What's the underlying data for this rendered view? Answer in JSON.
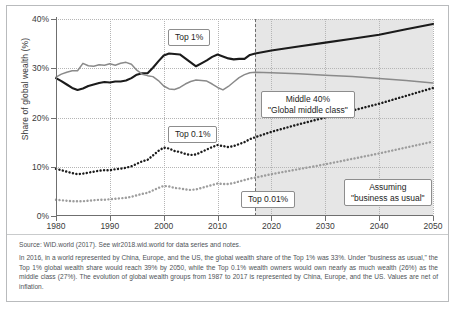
{
  "figure": {
    "source_line": "Source: WID.world (2017). See wir2018.wid.world for data series and notes.",
    "note": "In 2016, in a world represented by China, Europe, and the US, the global wealth share of the Top 1% was 33%. Under \"business as usual,\" the Top 1% global wealth share would reach 39% by 2050, while the Top 0.1% wealth owners would own nearly as much wealth (26%) as the middle class (27%). The evolution of global wealth groups from 1987 to 2017 is represented by China, Europe, and the US. Values are net of inflation."
  },
  "callouts": {
    "top1": "Top 1%",
    "middle40_line1": "Middle 40%",
    "middle40_line2": "\"Global middle class\"",
    "top01": "Top 0.1%",
    "top001": "Top 0.01%",
    "assuming_line1": "Assuming",
    "assuming_line2": "\"business as usual\""
  },
  "chart_data": {
    "type": "line",
    "title": "",
    "xlabel": "",
    "ylabel": "Share of global wealth (%)",
    "xlim": [
      1980,
      2050
    ],
    "ylim": [
      0,
      40
    ],
    "xticks": [
      1980,
      1990,
      2000,
      2010,
      2020,
      2030,
      2040,
      2050
    ],
    "xticklabels": [
      "1980",
      "1990",
      "2000",
      "2010",
      "2020",
      "2030",
      "2040",
      "2050"
    ],
    "yticks": [
      0,
      10,
      20,
      30,
      40
    ],
    "yticklabels": [
      "0%",
      "10%",
      "20%",
      "30%",
      "40%"
    ],
    "grid": true,
    "legend": "none (inline callout boxes)",
    "forecast_start": 2017,
    "forecast_shading": "#e2e2e2",
    "annotations": [
      {
        "text": "Top 1%",
        "x": 2000,
        "y": 36.5
      },
      {
        "text": "Middle 40% / \"Global middle class\"",
        "x": 2026,
        "y": 23.5
      },
      {
        "text": "Top 0.1%",
        "x": 2001,
        "y": 16.0
      },
      {
        "text": "Top 0.01%",
        "x": 2024,
        "y": 3.6
      },
      {
        "text": "Assuming \"business as usual\"",
        "x": 2040,
        "y": 5.4
      }
    ],
    "series": [
      {
        "name": "Top 1%",
        "color": "#1b1b1b",
        "style": "solid",
        "x": [
          1980,
          1981,
          1982,
          1983,
          1984,
          1985,
          1986,
          1987,
          1988,
          1989,
          1990,
          1991,
          1992,
          1993,
          1994,
          1995,
          1996,
          1997,
          1998,
          1999,
          2000,
          2001,
          2002,
          2003,
          2004,
          2005,
          2006,
          2007,
          2008,
          2009,
          2010,
          2011,
          2012,
          2013,
          2014,
          2015,
          2016,
          2017,
          2020,
          2025,
          2030,
          2035,
          2040,
          2045,
          2050
        ],
        "values": [
          28.0,
          27.4,
          26.7,
          26.0,
          25.6,
          25.9,
          26.4,
          26.7,
          27.0,
          27.2,
          27.1,
          27.3,
          27.3,
          27.5,
          28.0,
          28.7,
          29.0,
          29.0,
          30.1,
          31.4,
          32.6,
          33.0,
          32.9,
          32.8,
          32.0,
          31.2,
          30.4,
          31.0,
          31.6,
          32.3,
          32.8,
          32.4,
          32.0,
          31.8,
          31.9,
          31.9,
          32.7,
          33.0,
          33.6,
          34.4,
          35.2,
          36.0,
          36.8,
          37.9,
          39.0
        ]
      },
      {
        "name": "Middle 40%",
        "color": "#8a8a8a",
        "style": "solid",
        "x": [
          1980,
          1981,
          1982,
          1983,
          1984,
          1985,
          1986,
          1987,
          1988,
          1989,
          1990,
          1991,
          1992,
          1993,
          1994,
          1995,
          1996,
          1997,
          1998,
          1999,
          2000,
          2001,
          2002,
          2003,
          2004,
          2005,
          2006,
          2007,
          2008,
          2009,
          2010,
          2011,
          2012,
          2013,
          2014,
          2015,
          2016,
          2017,
          2020,
          2025,
          2030,
          2035,
          2040,
          2045,
          2050
        ],
        "values": [
          28.2,
          28.8,
          29.2,
          29.5,
          29.5,
          31.0,
          30.5,
          30.4,
          30.7,
          30.6,
          30.9,
          30.6,
          31.0,
          31.2,
          30.8,
          29.6,
          28.8,
          28.5,
          28.3,
          27.5,
          26.4,
          25.8,
          25.7,
          26.1,
          26.8,
          27.3,
          27.6,
          27.5,
          27.4,
          26.8,
          26.1,
          25.6,
          26.3,
          27.2,
          28.1,
          28.7,
          29.1,
          29.2,
          29.1,
          28.9,
          28.6,
          28.3,
          27.9,
          27.5,
          27.0
        ]
      },
      {
        "name": "Top 0.1%",
        "color": "#1b1b1b",
        "style": "dotted",
        "x": [
          1980,
          1981,
          1982,
          1983,
          1984,
          1985,
          1986,
          1987,
          1988,
          1989,
          1990,
          1991,
          1992,
          1993,
          1994,
          1995,
          1996,
          1997,
          1998,
          1999,
          2000,
          2001,
          2002,
          2003,
          2004,
          2005,
          2006,
          2007,
          2008,
          2009,
          2010,
          2011,
          2012,
          2013,
          2014,
          2015,
          2016,
          2017,
          2020,
          2025,
          2030,
          2035,
          2040,
          2045,
          2050
        ],
        "values": [
          9.6,
          9.3,
          9.0,
          8.7,
          8.5,
          8.6,
          8.8,
          9.0,
          9.2,
          9.3,
          9.3,
          9.5,
          9.6,
          9.8,
          10.1,
          10.6,
          11.1,
          11.4,
          12.3,
          13.2,
          13.9,
          13.7,
          13.2,
          13.0,
          12.6,
          12.4,
          12.5,
          13.0,
          13.5,
          14.0,
          14.4,
          14.2,
          14.0,
          14.2,
          14.6,
          15.0,
          15.6,
          16.0,
          17.1,
          18.6,
          20.0,
          21.4,
          22.8,
          24.4,
          26.0
        ]
      },
      {
        "name": "Top 0.01%",
        "color": "#9d9d9d",
        "style": "dotted",
        "x": [
          1980,
          1981,
          1982,
          1983,
          1984,
          1985,
          1986,
          1987,
          1988,
          1989,
          1990,
          1991,
          1992,
          1993,
          1994,
          1995,
          1996,
          1997,
          1998,
          1999,
          2000,
          2001,
          2002,
          2003,
          2004,
          2005,
          2006,
          2007,
          2008,
          2009,
          2010,
          2011,
          2012,
          2013,
          2014,
          2015,
          2016,
          2017,
          2020,
          2025,
          2030,
          2035,
          2040,
          2045,
          2050
        ],
        "values": [
          3.3,
          3.2,
          3.1,
          3.0,
          3.0,
          3.0,
          3.1,
          3.2,
          3.3,
          3.3,
          3.4,
          3.5,
          3.6,
          3.7,
          3.9,
          4.2,
          4.5,
          4.7,
          5.2,
          5.7,
          6.1,
          6.0,
          5.7,
          5.6,
          5.4,
          5.3,
          5.4,
          5.7,
          6.0,
          6.3,
          6.6,
          6.5,
          6.5,
          6.7,
          7.0,
          7.3,
          7.6,
          7.8,
          8.5,
          9.5,
          10.5,
          11.6,
          12.7,
          13.9,
          15.1
        ]
      }
    ]
  }
}
